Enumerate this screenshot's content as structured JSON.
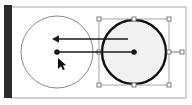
{
  "app": {
    "title": "Vector Editor Canvas",
    "description": "Circle object being moved with transform selection handles and motion arrows"
  },
  "canvas": {
    "background_color": "#ffffff",
    "page_border_color": "#b5b5b5",
    "page_rect": {
      "x": 11,
      "y": 7,
      "width": 175,
      "height": 91
    },
    "ruler": {
      "name": "vertical-toolbar-strip",
      "color": "#2b2b2b",
      "x": 4,
      "y": 5,
      "width": 8,
      "height": 93
    }
  },
  "objects": {
    "ghost_circle": {
      "label": "Ghost preview circle",
      "stroke_color": "#8a8a8a",
      "fill": "none",
      "stroke_width": 1,
      "cx": 57,
      "cy": 52,
      "r": 36,
      "center_dot_color": "#1a1a1a",
      "center_dot_radius": 2.6
    },
    "selected_circle": {
      "label": "Selected circle",
      "stroke_color": "#111111",
      "fill_color": "#f1f1f1",
      "stroke_width": 2.4,
      "cx": 134,
      "cy": 52,
      "r": 32,
      "center_dot_color": "#1a1a1a",
      "center_dot_radius": 2.6
    }
  },
  "selection": {
    "label": "Transform selection bounding box",
    "box": {
      "x": 99,
      "y": 19,
      "width": 70,
      "height": 66
    },
    "frame_color": "#9a9a9a",
    "handle_fill": "#ffffff",
    "handle_stroke": "#6e6e6e",
    "handle_size": 4,
    "handles": [
      {
        "name": "handle-top-left",
        "x": 99,
        "y": 19
      },
      {
        "name": "handle-top-center",
        "x": 134,
        "y": 19
      },
      {
        "name": "handle-top-right",
        "x": 169,
        "y": 19
      },
      {
        "name": "handle-middle-left",
        "x": 99,
        "y": 52
      },
      {
        "name": "handle-middle-right",
        "x": 169,
        "y": 52
      },
      {
        "name": "handle-bottom-left",
        "x": 99,
        "y": 85
      },
      {
        "name": "handle-bottom-center",
        "x": 134,
        "y": 85
      },
      {
        "name": "handle-bottom-right",
        "x": 169,
        "y": 85
      }
    ],
    "extra_handle": {
      "name": "handle-rotation-anchor",
      "x": 182,
      "y": 52,
      "connector_from_x": 169,
      "connector_to_x": 182
    }
  },
  "annotations": {
    "arrow_upper": {
      "name": "motion-arrow-upper",
      "label": "Move direction arrow",
      "color": "#1a1a1a",
      "x_start": 128,
      "x_end": 58,
      "y": 39,
      "stroke_width": 1.4,
      "arrowhead_size": 6
    },
    "arrow_lower": {
      "name": "center-offset-line",
      "label": "Center to center connector",
      "color": "#1a1a1a",
      "x_start": 134,
      "x_end": 57,
      "y": 52,
      "stroke_width": 1.6,
      "endpoint_dot_radius": 2.6
    }
  },
  "cursor": {
    "name": "mouse-pointer-cursor",
    "label": "Mouse arrow pointer",
    "x": 58,
    "y": 58,
    "color": "#111111"
  }
}
